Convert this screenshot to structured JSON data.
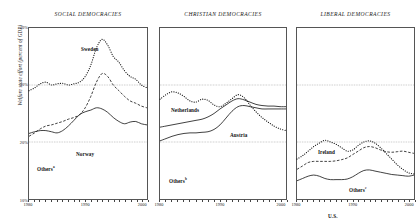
{
  "axes": {
    "ylabel": "Welfare state effort (percent of GDP)",
    "yticks": [
      "40%",
      "30%",
      "20%",
      "10%"
    ],
    "ytick_values": [
      40,
      30,
      20,
      10
    ],
    "xticks": [
      "1980",
      "1990",
      "2000"
    ],
    "xtick_values": [
      1980,
      1990,
      2000
    ]
  },
  "panels": [
    {
      "title": "SOCIAL DEMOCRACIES",
      "labels": [
        {
          "text": "Sweden",
          "sup": "",
          "x": 53,
          "y": 19
        },
        {
          "text": "Norway",
          "sup": "",
          "x": 48,
          "y": 124
        },
        {
          "text": "Others",
          "sup": "a",
          "x": 9,
          "y": 138
        }
      ]
    },
    {
      "title": "CHRISTIAN DEMOCRACIES",
      "labels": [
        {
          "text": "Netherlands",
          "sup": "",
          "x": 12,
          "y": 80
        },
        {
          "text": "Austria",
          "sup": "",
          "x": 71,
          "y": 105
        },
        {
          "text": "Others",
          "sup": "b",
          "x": 10,
          "y": 150
        }
      ]
    },
    {
      "title": "LIBERAL DEMOCRACIES",
      "labels": [
        {
          "text": "Ireland",
          "sup": "",
          "x": 22,
          "y": 122
        },
        {
          "text": "Others",
          "sup": "c",
          "x": 53,
          "y": 159
        },
        {
          "text": "U.S.",
          "sup": "",
          "x": 32,
          "y": 186
        }
      ]
    }
  ],
  "chart_data": {
    "type": "line",
    "title": "",
    "xlabel": "",
    "ylabel": "Welfare state effort (percent of GDP)",
    "xlim": [
      1980,
      2001
    ],
    "ylim": [
      10,
      40
    ],
    "grid": "horizontal dotted reference lines at 20% and 30%",
    "gridlines": [
      20,
      30
    ],
    "legend": "inline labels next to each curve",
    "panels": [
      {
        "name": "SOCIAL DEMOCRACIES",
        "series": [
          {
            "name": "Sweden",
            "style": "dotted",
            "x": [
              1980,
              1981,
              1982,
              1983,
              1984,
              1985,
              1986,
              1987,
              1988,
              1989,
              1990,
              1991,
              1992,
              1993,
              1994,
              1995,
              1996,
              1997,
              1998,
              1999,
              2000,
              2001
            ],
            "values": [
              29.0,
              29.5,
              30.2,
              30.5,
              30.0,
              30.2,
              30.3,
              30.0,
              30.2,
              30.5,
              31.5,
              33.5,
              36.5,
              38.0,
              37.0,
              35.0,
              34.0,
              32.5,
              31.5,
              31.0,
              30.0,
              29.5
            ]
          },
          {
            "name": "Others",
            "style": "dashed",
            "x": [
              1980,
              1981,
              1982,
              1983,
              1984,
              1985,
              1986,
              1987,
              1988,
              1989,
              1990,
              1991,
              1992,
              1993,
              1994,
              1995,
              1996,
              1997,
              1998,
              1999,
              2000,
              2001
            ],
            "values": [
              21.0,
              21.6,
              22.3,
              22.8,
              23.0,
              23.3,
              23.6,
              24.0,
              24.3,
              24.8,
              26.0,
              28.0,
              30.5,
              32.0,
              31.5,
              30.0,
              29.0,
              28.0,
              27.2,
              26.8,
              26.3,
              26.0
            ]
          },
          {
            "name": "Norway",
            "style": "solid",
            "x": [
              1980,
              1981,
              1982,
              1983,
              1984,
              1985,
              1986,
              1987,
              1988,
              1989,
              1990,
              1991,
              1992,
              1993,
              1994,
              1995,
              1996,
              1997,
              1998,
              1999,
              2000,
              2001
            ],
            "values": [
              21.5,
              21.8,
              22.0,
              22.0,
              21.8,
              21.6,
              22.0,
              22.8,
              23.8,
              24.8,
              25.3,
              25.6,
              26.0,
              25.8,
              25.2,
              24.3,
              23.6,
              23.2,
              23.5,
              23.6,
              23.2,
              23.0
            ]
          }
        ]
      },
      {
        "name": "CHRISTIAN DEMOCRACIES",
        "series": [
          {
            "name": "Netherlands",
            "style": "dotted",
            "x": [
              1980,
              1981,
              1982,
              1983,
              1984,
              1985,
              1986,
              1987,
              1988,
              1989,
              1990,
              1991,
              1992,
              1993,
              1994,
              1995,
              1996,
              1997,
              1998,
              1999,
              2000,
              2001
            ],
            "values": [
              27.5,
              28.3,
              28.8,
              28.6,
              28.0,
              27.2,
              27.0,
              27.5,
              27.3,
              26.5,
              26.2,
              26.8,
              27.6,
              28.3,
              27.8,
              26.5,
              25.3,
              24.3,
              23.5,
              22.8,
              22.3,
              22.0
            ]
          },
          {
            "name": "Austria",
            "style": "solid",
            "x": [
              1980,
              1981,
              1982,
              1983,
              1984,
              1985,
              1986,
              1987,
              1988,
              1989,
              1990,
              1991,
              1992,
              1993,
              1994,
              1995,
              1996,
              1997,
              1998,
              1999,
              2000,
              2001
            ],
            "values": [
              22.6,
              22.8,
              23.0,
              23.2,
              23.4,
              23.6,
              23.8,
              24.0,
              24.4,
              25.0,
              25.8,
              26.5,
              27.2,
              27.6,
              27.4,
              27.0,
              26.6,
              26.4,
              26.3,
              26.3,
              26.2,
              26.2
            ]
          },
          {
            "name": "Others",
            "style": "solid",
            "x": [
              1980,
              1981,
              1982,
              1983,
              1984,
              1985,
              1986,
              1987,
              1988,
              1989,
              1990,
              1991,
              1992,
              1993,
              1994,
              1995,
              1996,
              1997,
              1998,
              1999,
              2000,
              2001
            ],
            "values": [
              20.2,
              20.6,
              21.0,
              21.3,
              21.5,
              21.6,
              21.6,
              21.7,
              21.8,
              22.2,
              23.0,
              24.2,
              25.4,
              26.2,
              26.4,
              26.2,
              26.0,
              25.8,
              25.8,
              25.8,
              25.8,
              25.8
            ]
          }
        ]
      },
      {
        "name": "LIBERAL DEMOCRACIES",
        "series": [
          {
            "name": "Ireland",
            "style": "dotted",
            "x": [
              1980,
              1981,
              1982,
              1983,
              1984,
              1985,
              1986,
              1987,
              1988,
              1989,
              1990,
              1991,
              1992,
              1993,
              1994,
              1995,
              1996,
              1997,
              1998,
              1999,
              2000,
              2001
            ],
            "values": [
              17.0,
              17.6,
              18.4,
              19.2,
              19.8,
              20.3,
              20.0,
              19.6,
              19.0,
              18.4,
              18.6,
              19.4,
              20.0,
              20.2,
              19.8,
              19.0,
              18.0,
              17.0,
              16.0,
              15.2,
              14.6,
              14.4
            ]
          },
          {
            "name": "Others",
            "style": "dashed",
            "x": [
              1980,
              1981,
              1982,
              1983,
              1984,
              1985,
              1986,
              1987,
              1988,
              1989,
              1990,
              1991,
              1992,
              1993,
              1994,
              1995,
              1996,
              1997,
              1998,
              1999,
              2000,
              2001
            ],
            "values": [
              15.2,
              15.8,
              16.4,
              16.6,
              16.6,
              16.6,
              16.6,
              16.7,
              16.9,
              17.2,
              17.8,
              18.4,
              19.0,
              19.2,
              19.0,
              18.6,
              18.3,
              18.2,
              18.3,
              18.4,
              18.2,
              18.0
            ]
          },
          {
            "name": "U.S.",
            "style": "solid",
            "x": [
              1980,
              1981,
              1982,
              1983,
              1984,
              1985,
              1986,
              1987,
              1988,
              1989,
              1990,
              1991,
              1992,
              1993,
              1994,
              1995,
              1996,
              1997,
              1998,
              1999,
              2000,
              2001
            ],
            "values": [
              13.2,
              13.6,
              14.0,
              14.2,
              14.0,
              13.6,
              13.4,
              13.4,
              13.4,
              13.5,
              13.9,
              14.5,
              15.0,
              15.1,
              14.9,
              14.7,
              14.5,
              14.3,
              14.2,
              14.1,
              14.0,
              14.2
            ]
          }
        ]
      }
    ]
  }
}
